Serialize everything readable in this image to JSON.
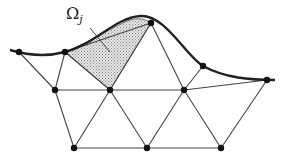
{
  "diagram": {
    "label": {
      "symbol": "Ω",
      "subscript": "j"
    },
    "colors": {
      "edge": "#444444",
      "boundary": "#222222",
      "node": "#111111",
      "shade": "#c8c8c8"
    },
    "nodes": [
      [
        19,
        52
      ],
      [
        65,
        52
      ],
      [
        151,
        23
      ],
      [
        203,
        66
      ],
      [
        267,
        80
      ],
      [
        55,
        90
      ],
      [
        110,
        90
      ],
      [
        184,
        90
      ],
      [
        74,
        148
      ],
      [
        147,
        148
      ],
      [
        221,
        148
      ]
    ]
  }
}
